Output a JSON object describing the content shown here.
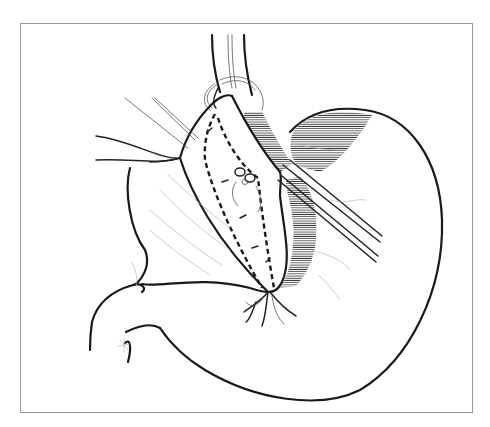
{
  "figure": {
    "type": "surgical line illustration",
    "colors": {
      "ink": "#1a1a1a",
      "frame": "#9a9a9a",
      "background": "#ffffff"
    },
    "labels": []
  }
}
